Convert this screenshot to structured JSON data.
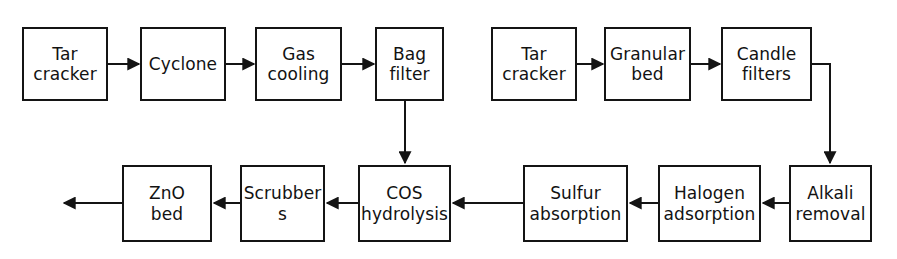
{
  "diagram": {
    "type": "flowchart",
    "background_color": "#ffffff",
    "stroke_color": "#141414",
    "text_color": "#121212",
    "trains": [
      {
        "name": "train-a",
        "stages": [
          "Tar cracker",
          "Cyclone",
          "Gas cooling",
          "Bag filter",
          "COS hydrolysis",
          "Scrubbers",
          "ZnO bed"
        ]
      },
      {
        "name": "train-b",
        "stages": [
          "Tar cracker",
          "Granular bed",
          "Candle filters",
          "Alkali removal",
          "Halogen adsorption",
          "Sulfur absorption"
        ]
      }
    ],
    "nodes": [
      {
        "id": "tar-cracker-a",
        "label": "Tar\ncracker",
        "x": 22,
        "y": 27,
        "w": 86,
        "h": 74
      },
      {
        "id": "cyclone",
        "label": "Cyclone",
        "x": 140,
        "y": 27,
        "w": 86,
        "h": 74
      },
      {
        "id": "gas-cooling",
        "label": "Gas\ncooling",
        "x": 255,
        "y": 27,
        "w": 87,
        "h": 74
      },
      {
        "id": "bag-filter",
        "label": "Bag\nfilter",
        "x": 375,
        "y": 27,
        "w": 69,
        "h": 74
      },
      {
        "id": "tar-cracker-b",
        "label": "Tar\ncracker",
        "x": 491,
        "y": 27,
        "w": 86,
        "h": 74
      },
      {
        "id": "granular-bed",
        "label": "Granular\nbed",
        "x": 604,
        "y": 27,
        "w": 87,
        "h": 74
      },
      {
        "id": "candle-filters",
        "label": "Candle\nfilters",
        "x": 721,
        "y": 27,
        "w": 91,
        "h": 74
      },
      {
        "id": "zno-bed",
        "label": "ZnO\nbed",
        "x": 122,
        "y": 165,
        "w": 90,
        "h": 77
      },
      {
        "id": "scrubbers",
        "label": "Scrubber\ns",
        "x": 240,
        "y": 165,
        "w": 85,
        "h": 77
      },
      {
        "id": "cos-hydrolysis",
        "label": "COS\nhydrolysis",
        "x": 358,
        "y": 165,
        "w": 93,
        "h": 77
      },
      {
        "id": "sulfur-absorption",
        "label": "Sulfur\nabsorption",
        "x": 523,
        "y": 165,
        "w": 105,
        "h": 77
      },
      {
        "id": "halogen-adsorption",
        "label": "Halogen\nadsorption",
        "x": 658,
        "y": 165,
        "w": 103,
        "h": 77
      },
      {
        "id": "alkali-removal",
        "label": "Alkali\nremoval",
        "x": 789,
        "y": 165,
        "w": 83,
        "h": 77
      }
    ],
    "connectors": [
      {
        "id": "arrow-tar-cracker-a-to-cyclone",
        "direction": "right"
      },
      {
        "id": "arrow-cyclone-to-gas-cooling",
        "direction": "right"
      },
      {
        "id": "arrow-gas-cooling-to-bag-filter",
        "direction": "right"
      },
      {
        "id": "arrow-bag-filter-to-cos-hydrolysis",
        "direction": "down"
      },
      {
        "id": "arrow-cos-hydrolysis-to-scrubbers",
        "direction": "left"
      },
      {
        "id": "arrow-scrubbers-to-zno-bed",
        "direction": "left"
      },
      {
        "id": "arrow-zno-bed-outlet",
        "direction": "left"
      },
      {
        "id": "arrow-tar-cracker-b-to-granular-bed",
        "direction": "right"
      },
      {
        "id": "arrow-granular-bed-to-candle-filters",
        "direction": "right"
      },
      {
        "id": "arrow-candle-filters-to-alkali-removal",
        "direction": "down"
      },
      {
        "id": "arrow-alkali-removal-to-halogen-adsorption",
        "direction": "left"
      },
      {
        "id": "arrow-halogen-adsorption-to-sulfur-absorption",
        "direction": "left"
      },
      {
        "id": "arrow-sulfur-absorption-outlet",
        "direction": "left"
      }
    ]
  }
}
